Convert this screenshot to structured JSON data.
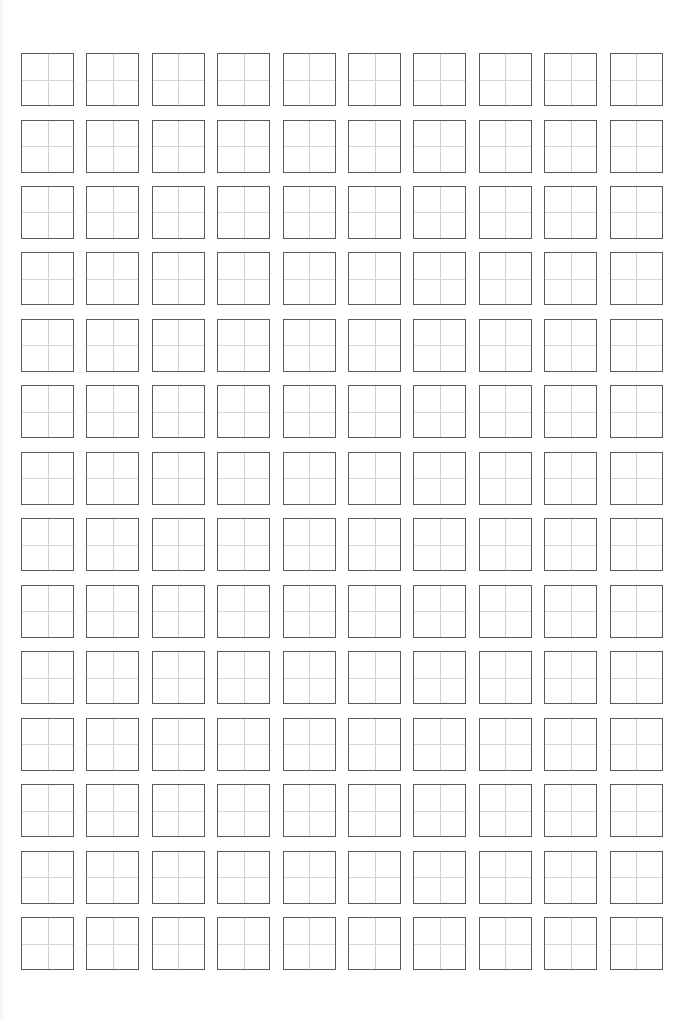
{
  "page": {
    "title": "",
    "type": "tianzige-writing-practice-sheet",
    "background": "#ffffff"
  },
  "grid": {
    "rows": 14,
    "columns": 10,
    "cell_size_px": 53,
    "origin_x": 21,
    "origin_y": 53,
    "pitch_x": 65.4,
    "pitch_y": 66.46,
    "border_color": "#5a5a5a",
    "guide_line_color": "#cfcfcf",
    "guide_style": "cross (田字格)",
    "cells_filled": 0
  }
}
